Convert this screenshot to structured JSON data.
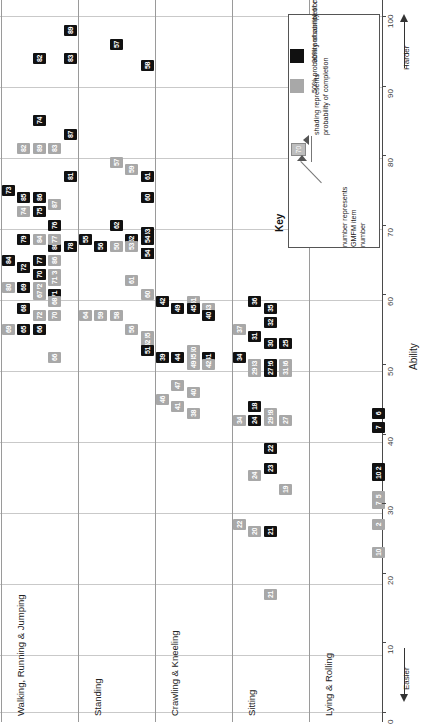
{
  "chart_data": {
    "type": "scatter",
    "xlabel": "",
    "ylabel": "Ability",
    "ylim": [
      0,
      100
    ],
    "yticks": [
      0,
      10,
      20,
      30,
      40,
      50,
      60,
      70,
      80,
      90,
      100
    ],
    "grid": true,
    "legend_position": "top-right",
    "direction_labels": {
      "high": "Harder",
      "low": "Easier"
    },
    "categories": [
      "Lying & Rolling",
      "Sitting",
      "Crawling & Kneeling",
      "Standing",
      "Walking, Running & Jumping"
    ],
    "series": [
      {
        "name": "50% probability of completion",
        "color": "#a8a8a8"
      },
      {
        "name": "90% probability of completion",
        "color": "#111111"
      }
    ],
    "points": [
      {
        "item": 89,
        "dim": "Walking, Running & Jumping",
        "ability": 98,
        "prob": 90,
        "lane": 4
      },
      {
        "item": 82,
        "dim": "Walking, Running & Jumping",
        "ability": 94,
        "prob": 90,
        "lane": 2
      },
      {
        "item": 83,
        "dim": "Walking, Running & Jumping",
        "ability": 94,
        "prob": 90,
        "lane": 4
      },
      {
        "item": 57,
        "dim": "Standing",
        "ability": 96,
        "prob": 90,
        "lane": 2
      },
      {
        "item": 58,
        "dim": "Standing",
        "ability": 93,
        "prob": 90,
        "lane": 4
      },
      {
        "item": 74,
        "dim": "Walking, Running & Jumping",
        "ability": 85,
        "prob": 90,
        "lane": 2
      },
      {
        "item": 87,
        "dim": "Walking, Running & Jumping",
        "ability": 83,
        "prob": 90,
        "lane": 4
      },
      {
        "item": 82,
        "dim": "Walking, Running & Jumping",
        "ability": 81,
        "prob": 50,
        "lane": 1
      },
      {
        "item": 89,
        "dim": "Walking, Running & Jumping",
        "ability": 81,
        "prob": 50,
        "lane": 2
      },
      {
        "item": 83,
        "dim": "Walking, Running & Jumping",
        "ability": 81,
        "prob": 50,
        "lane": 3
      },
      {
        "item": 57,
        "dim": "Standing",
        "ability": 79,
        "prob": 50,
        "lane": 2
      },
      {
        "item": 59,
        "dim": "Standing",
        "ability": 78,
        "prob": 50,
        "lane": 3
      },
      {
        "item": 81,
        "dim": "Walking, Running & Jumping",
        "ability": 77,
        "prob": 90,
        "lane": 4
      },
      {
        "item": 61,
        "dim": "Standing",
        "ability": 77,
        "prob": 90,
        "lane": 4
      },
      {
        "item": 73,
        "dim": "Walking, Running & Jumping",
        "ability": 75,
        "prob": 90,
        "lane": 0
      },
      {
        "item": 85,
        "dim": "Walking, Running & Jumping",
        "ability": 74,
        "prob": 90,
        "lane": 1
      },
      {
        "item": 86,
        "dim": "Walking, Running & Jumping",
        "ability": 74,
        "prob": 90,
        "lane": 2
      },
      {
        "item": 87,
        "dim": "Walking, Running & Jumping",
        "ability": 73,
        "prob": 50,
        "lane": 3
      },
      {
        "item": 60,
        "dim": "Standing",
        "ability": 74,
        "prob": 90,
        "lane": 4
      },
      {
        "item": 74,
        "dim": "Walking, Running & Jumping",
        "ability": 72,
        "prob": 50,
        "lane": 1
      },
      {
        "item": 75,
        "dim": "Walking, Running & Jumping",
        "ability": 72,
        "prob": 90,
        "lane": 2
      },
      {
        "item": 76,
        "dim": "Walking, Running & Jumping",
        "ability": 70,
        "prob": 90,
        "lane": 3
      },
      {
        "item": 62,
        "dim": "Standing",
        "ability": 70,
        "prob": 90,
        "lane": 2
      },
      {
        "item": 63,
        "dim": "Standing",
        "ability": 69,
        "prob": 90,
        "lane": 4
      },
      {
        "item": 88,
        "dim": "Walking, Running & Jumping",
        "ability": 67,
        "prob": 90,
        "lane": 3
      },
      {
        "item": 84,
        "dim": "Walking, Running & Jumping",
        "ability": 65,
        "prob": 90,
        "lane": 0
      },
      {
        "item": 77,
        "dim": "Walking, Running & Jumping",
        "ability": 65,
        "prob": 90,
        "lane": 2
      },
      {
        "item": 86,
        "dim": "Walking, Running & Jumping",
        "ability": 65,
        "prob": 50,
        "lane": 3
      },
      {
        "item": 81,
        "dim": "Walking, Running & Jumping",
        "ability": 64,
        "prob": 50,
        "lane": 1
      },
      {
        "item": 85,
        "dim": "Walking, Running & Jumping",
        "ability": 63,
        "prob": 50,
        "lane": 2
      },
      {
        "item": 73,
        "dim": "Walking, Running & Jumping",
        "ability": 63,
        "prob": 50,
        "lane": 3
      },
      {
        "item": 61,
        "dim": "Standing",
        "ability": 62,
        "prob": 50,
        "lane": 3
      },
      {
        "item": 80,
        "dim": "Walking, Running & Jumping",
        "ability": 61,
        "prob": 50,
        "lane": 0
      },
      {
        "item": 73,
        "dim": "Walking, Running & Jumping",
        "ability": 61,
        "prob": 50,
        "lane": 1
      },
      {
        "item": 72,
        "dim": "Walking, Running & Jumping",
        "ability": 61,
        "prob": 50,
        "lane": 2
      },
      {
        "item": 71,
        "dim": "Walking, Running & Jumping",
        "ability": 60,
        "prob": 90,
        "lane": 3
      },
      {
        "item": 60,
        "dim": "Standing",
        "ability": 60,
        "prob": 50,
        "lane": 4
      },
      {
        "item": 79,
        "dim": "Walking, Running & Jumping",
        "ability": 68,
        "prob": 90,
        "lane": 1
      },
      {
        "item": 84,
        "dim": "Walking, Running & Jumping",
        "ability": 68,
        "prob": 50,
        "lane": 2
      },
      {
        "item": 77,
        "dim": "Walking, Running & Jumping",
        "ability": 68,
        "prob": 50,
        "lane": 3
      },
      {
        "item": 78,
        "dim": "Walking, Running & Jumping",
        "ability": 67,
        "prob": 90,
        "lane": 4
      },
      {
        "item": 55,
        "dim": "Standing",
        "ability": 68,
        "prob": 90,
        "lane": 0
      },
      {
        "item": 56,
        "dim": "Standing",
        "ability": 67,
        "prob": 90,
        "lane": 1
      },
      {
        "item": 52,
        "dim": "Standing",
        "ability": 68,
        "prob": 90,
        "lane": 3
      },
      {
        "item": 54,
        "dim": "Standing",
        "ability": 68,
        "prob": 90,
        "lane": 4
      },
      {
        "item": 50,
        "dim": "Standing",
        "ability": 67,
        "prob": 50,
        "lane": 2
      },
      {
        "item": 53,
        "dim": "Standing",
        "ability": 67,
        "prob": 50,
        "lane": 3
      },
      {
        "item": 53,
        "dim": "Standing",
        "ability": 66,
        "prob": 90,
        "lane": 4
      },
      {
        "item": 54,
        "dim": "Standing",
        "ability": 66,
        "prob": 90,
        "lane": 4
      },
      {
        "item": 72,
        "dim": "Walking, Running & Jumping",
        "ability": 64,
        "prob": 90,
        "lane": 1
      },
      {
        "item": 70,
        "dim": "Walking, Running & Jumping",
        "ability": 63,
        "prob": 90,
        "lane": 2
      },
      {
        "item": 71,
        "dim": "Walking, Running & Jumping",
        "ability": 62,
        "prob": 50,
        "lane": 3
      },
      {
        "item": 69,
        "dim": "Walking, Running & Jumping",
        "ability": 61,
        "prob": 90,
        "lane": 1
      },
      {
        "item": 67,
        "dim": "Walking, Running & Jumping",
        "ability": 60,
        "prob": 50,
        "lane": 2
      },
      {
        "item": 68,
        "dim": "Walking, Running & Jumping",
        "ability": 59,
        "prob": 50,
        "lane": 3
      },
      {
        "item": 68,
        "dim": "Walking, Running & Jumping",
        "ability": 58,
        "prob": 90,
        "lane": 1
      },
      {
        "item": 72,
        "dim": "Walking, Running & Jumping",
        "ability": 57,
        "prob": 50,
        "lane": 2
      },
      {
        "item": 70,
        "dim": "Walking, Running & Jumping",
        "ability": 57,
        "prob": 50,
        "lane": 3
      },
      {
        "item": 64,
        "dim": "Standing",
        "ability": 57,
        "prob": 50,
        "lane": 0
      },
      {
        "item": 59,
        "dim": "Standing",
        "ability": 57,
        "prob": 50,
        "lane": 1
      },
      {
        "item": 58,
        "dim": "Standing",
        "ability": 57,
        "prob": 50,
        "lane": 2
      },
      {
        "item": 69,
        "dim": "Walking, Running & Jumping",
        "ability": 55,
        "prob": 50,
        "lane": 0
      },
      {
        "item": 65,
        "dim": "Walking, Running & Jumping",
        "ability": 55,
        "prob": 90,
        "lane": 1
      },
      {
        "item": 66,
        "dim": "Walking, Running & Jumping",
        "ability": 55,
        "prob": 90,
        "lane": 2
      },
      {
        "item": 56,
        "dim": "Standing",
        "ability": 55,
        "prob": 50,
        "lane": 3
      },
      {
        "item": 55,
        "dim": "Standing",
        "ability": 54,
        "prob": 50,
        "lane": 4
      },
      {
        "item": 52,
        "dim": "Standing",
        "ability": 53,
        "prob": 50,
        "lane": 4
      },
      {
        "item": 51,
        "dim": "Standing",
        "ability": 52,
        "prob": 90,
        "lane": 4
      },
      {
        "item": 66,
        "dim": "Walking, Running & Jumping",
        "ability": 51,
        "prob": 50,
        "lane": 3
      },
      {
        "item": 42,
        "dim": "Crawling & Kneeling",
        "ability": 59,
        "prob": 90,
        "lane": 0
      },
      {
        "item": 49,
        "dim": "Crawling & Kneeling",
        "ability": 58,
        "prob": 90,
        "lane": 1
      },
      {
        "item": 51,
        "dim": "Crawling & Kneeling",
        "ability": 59,
        "prob": 50,
        "lane": 2
      },
      {
        "item": 45,
        "dim": "Crawling & Kneeling",
        "ability": 58,
        "prob": 90,
        "lane": 2
      },
      {
        "item": 43,
        "dim": "Crawling & Kneeling",
        "ability": 58,
        "prob": 50,
        "lane": 3
      },
      {
        "item": 40,
        "dim": "Crawling & Kneeling",
        "ability": 57,
        "prob": 90,
        "lane": 3
      },
      {
        "item": 36,
        "dim": "Sitting",
        "ability": 59,
        "prob": 90,
        "lane": 1
      },
      {
        "item": 35,
        "dim": "Sitting",
        "ability": 58,
        "prob": 90,
        "lane": 2
      },
      {
        "item": 32,
        "dim": "Sitting",
        "ability": 56,
        "prob": 90,
        "lane": 2
      },
      {
        "item": 37,
        "dim": "Sitting",
        "ability": 55,
        "prob": 50,
        "lane": 0
      },
      {
        "item": 31,
        "dim": "Sitting",
        "ability": 54,
        "prob": 90,
        "lane": 1
      },
      {
        "item": 30,
        "dim": "Sitting",
        "ability": 53,
        "prob": 90,
        "lane": 2
      },
      {
        "item": 25,
        "dim": "Sitting",
        "ability": 53,
        "prob": 90,
        "lane": 3
      },
      {
        "item": 48,
        "dim": "Crawling & Kneeling",
        "ability": 51,
        "prob": 50,
        "lane": 0
      },
      {
        "item": 44,
        "dim": "Crawling & Kneeling",
        "ability": 51,
        "prob": 90,
        "lane": 1
      },
      {
        "item": 50,
        "dim": "Crawling & Kneeling",
        "ability": 52,
        "prob": 50,
        "lane": 2
      },
      {
        "item": 45,
        "dim": "Crawling & Kneeling",
        "ability": 51,
        "prob": 50,
        "lane": 2
      },
      {
        "item": 41,
        "dim": "Crawling & Kneeling",
        "ability": 51,
        "prob": 90,
        "lane": 3
      },
      {
        "item": 39,
        "dim": "Crawling & Kneeling",
        "ability": 51,
        "prob": 90,
        "lane": 0
      },
      {
        "item": 42,
        "dim": "Crawling & Kneeling",
        "ability": 50,
        "prob": 50,
        "lane": 3
      },
      {
        "item": 49,
        "dim": "Crawling & Kneeling",
        "ability": 50,
        "prob": 50,
        "lane": 2
      },
      {
        "item": 34,
        "dim": "Sitting",
        "ability": 51,
        "prob": 90,
        "lane": 0
      },
      {
        "item": 33,
        "dim": "Sitting",
        "ability": 50,
        "prob": 50,
        "lane": 1
      },
      {
        "item": 26,
        "dim": "Sitting",
        "ability": 50,
        "prob": 90,
        "lane": 2
      },
      {
        "item": 36,
        "dim": "Sitting",
        "ability": 50,
        "prob": 50,
        "lane": 3
      },
      {
        "item": 29,
        "dim": "Sitting",
        "ability": 49,
        "prob": 50,
        "lane": 1
      },
      {
        "item": 27,
        "dim": "Sitting",
        "ability": 49,
        "prob": 90,
        "lane": 2
      },
      {
        "item": 31,
        "dim": "Sitting",
        "ability": 49,
        "prob": 50,
        "lane": 3
      },
      {
        "item": 47,
        "dim": "Crawling & Kneeling",
        "ability": 47,
        "prob": 50,
        "lane": 1
      },
      {
        "item": 40,
        "dim": "Crawling & Kneeling",
        "ability": 46,
        "prob": 50,
        "lane": 2
      },
      {
        "item": 46,
        "dim": "Crawling & Kneeling",
        "ability": 45,
        "prob": 50,
        "lane": 0
      },
      {
        "item": 41,
        "dim": "Crawling & Kneeling",
        "ability": 44,
        "prob": 50,
        "lane": 1
      },
      {
        "item": 38,
        "dim": "Crawling & Kneeling",
        "ability": 43,
        "prob": 50,
        "lane": 2
      },
      {
        "item": 18,
        "dim": "Sitting",
        "ability": 44,
        "prob": 90,
        "lane": 1
      },
      {
        "item": 28,
        "dim": "Sitting",
        "ability": 43,
        "prob": 50,
        "lane": 2
      },
      {
        "item": 34,
        "dim": "Sitting",
        "ability": 42,
        "prob": 50,
        "lane": 0
      },
      {
        "item": 24,
        "dim": "Sitting",
        "ability": 42,
        "prob": 90,
        "lane": 1
      },
      {
        "item": 29,
        "dim": "Sitting",
        "ability": 42,
        "prob": 50,
        "lane": 2
      },
      {
        "item": 27,
        "dim": "Sitting",
        "ability": 42,
        "prob": 50,
        "lane": 3
      },
      {
        "item": 6,
        "dim": "Lying & Rolling",
        "ability": 43,
        "prob": 90,
        "lane": 4
      },
      {
        "item": 7,
        "dim": "Lying & Rolling",
        "ability": 41,
        "prob": 90,
        "lane": 4
      },
      {
        "item": 22,
        "dim": "Sitting",
        "ability": 38,
        "prob": 90,
        "lane": 2
      },
      {
        "item": 23,
        "dim": "Sitting",
        "ability": 35,
        "prob": 90,
        "lane": 2
      },
      {
        "item": 24,
        "dim": "Sitting",
        "ability": 34,
        "prob": 50,
        "lane": 1
      },
      {
        "item": 19,
        "dim": "Sitting",
        "ability": 32,
        "prob": 50,
        "lane": 3
      },
      {
        "item": 2,
        "dim": "Lying & Rolling",
        "ability": 35,
        "prob": 90,
        "lane": 4
      },
      {
        "item": 10,
        "dim": "Lying & Rolling",
        "ability": 34,
        "prob": 90,
        "lane": 4
      },
      {
        "item": 5,
        "dim": "Lying & Rolling",
        "ability": 31,
        "prob": 50,
        "lane": 4
      },
      {
        "item": 7,
        "dim": "Lying & Rolling",
        "ability": 30,
        "prob": 50,
        "lane": 4
      },
      {
        "item": 22,
        "dim": "Sitting",
        "ability": 27,
        "prob": 50,
        "lane": 0
      },
      {
        "item": 20,
        "dim": "Sitting",
        "ability": 26,
        "prob": 50,
        "lane": 1
      },
      {
        "item": 21,
        "dim": "Sitting",
        "ability": 26,
        "prob": 90,
        "lane": 2
      },
      {
        "item": 2,
        "dim": "Lying & Rolling",
        "ability": 27,
        "prob": 50,
        "lane": 4
      },
      {
        "item": 10,
        "dim": "Lying & Rolling",
        "ability": 23,
        "prob": 50,
        "lane": 4
      },
      {
        "item": 21,
        "dim": "Sitting",
        "ability": 17,
        "prob": 50,
        "lane": 2
      }
    ]
  },
  "legend": {
    "title": "Key",
    "shading_note": "shading represents\nprobability of completion",
    "shading_note_line1": "shading represents",
    "shading_note_line2": "probability of completion",
    "number_note_line1": "number represents",
    "number_note_line2": "GMFM item",
    "number_note_line3": "number",
    "sample_number": "70",
    "entry_50": "50% probability of completion",
    "entry_90": "90% probability of completion",
    "color_50": "#a8a8a8",
    "color_90": "#111111"
  },
  "axis": {
    "ability_label": "Ability",
    "harder_label": "Harder",
    "easier_label": "Easier",
    "ticks": [
      "0",
      "10",
      "20",
      "30",
      "40",
      "50",
      "60",
      "70",
      "80",
      "90",
      "100"
    ]
  },
  "dimensions": [
    {
      "label": "Walking, Running & Jumping"
    },
    {
      "label": "Standing"
    },
    {
      "label": "Crawling & Kneeling"
    },
    {
      "label": "Sitting"
    },
    {
      "label": "Lying & Rolling"
    }
  ]
}
